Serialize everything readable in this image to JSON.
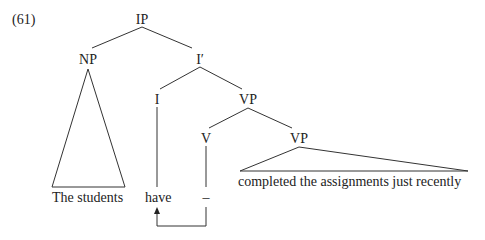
{
  "example_number": "(61)",
  "nodes": {
    "ip": "IP",
    "np": "NP",
    "i_bar": "I′",
    "i": "I",
    "vp_upper": "VP",
    "v": "V",
    "vp_lower": "VP"
  },
  "leaves": {
    "np_text": "The students",
    "i_text": "have",
    "v_trace": "–",
    "vp_text": "completed the assignments just recently"
  },
  "colors": {
    "line": "#333333",
    "text": "#222222",
    "background": "#ffffff"
  }
}
